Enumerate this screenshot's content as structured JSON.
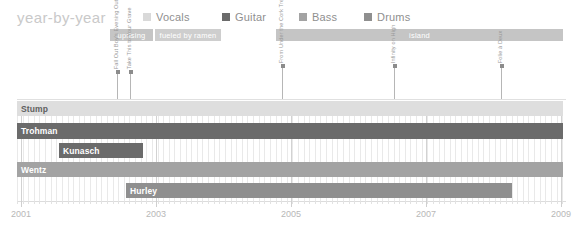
{
  "header": {
    "title": "year-by-year"
  },
  "legend": {
    "items": [
      {
        "label": "Vocals",
        "color": "#d9d9d9",
        "x": 0
      },
      {
        "label": "Guitar",
        "color": "#6b6b6b",
        "x": 79
      },
      {
        "label": "Bass",
        "color": "#a3a3a3",
        "x": 156
      },
      {
        "label": "Drums",
        "color": "#8f8f8f",
        "x": 221
      }
    ]
  },
  "label_bands": [
    {
      "name": "uprising",
      "color": "#c5c5c5",
      "left": 110,
      "width": 43
    },
    {
      "name": "fueled by ramen",
      "color": "#cecece",
      "left": 155,
      "width": 66
    },
    {
      "name": "island",
      "color": "#c5c5c5",
      "left": 276,
      "width": 287
    }
  ],
  "albums": [
    {
      "title": "Fall Out Boy's Evening Out with Your Girlfriend",
      "x": 117,
      "stem": 28
    },
    {
      "title": "Take This to Your Grave",
      "x": 130,
      "stem": 28
    },
    {
      "title": "From Under the Cork Tree",
      "x": 282,
      "stem": 34
    },
    {
      "title": "Infinity on High",
      "x": 394,
      "stem": 34
    },
    {
      "title": "Folie à Deux",
      "x": 501,
      "stem": 34
    }
  ],
  "chart_data": {
    "type": "bar",
    "title": "year-by-year",
    "xlabel": "",
    "ylabel": "",
    "xlim": [
      2001,
      2009.9
    ],
    "grid": true,
    "legend_position": "top",
    "categories": [
      "Stump",
      "Trohman",
      "Kunasch",
      "Wentz",
      "Hurley"
    ],
    "series": [
      {
        "name": "Stump",
        "role": "Vocals",
        "color": "#dedede",
        "start": 2001.0,
        "end": 2009.85,
        "label_color": "#6e6e6e"
      },
      {
        "name": "Trohman",
        "role": "Guitar",
        "color": "#6b6b6b",
        "start": 2001.0,
        "end": 2009.85,
        "label_color": "#ffffff"
      },
      {
        "name": "Kunasch",
        "role": "Guitar",
        "color": "#6b6b6b",
        "start": 2001.68,
        "end": 2003.03,
        "label_color": "#ffffff"
      },
      {
        "name": "Wentz",
        "role": "Bass",
        "color": "#a3a3a3",
        "start": 2001.0,
        "end": 2009.85,
        "label_color": "#ffffff"
      },
      {
        "name": "Hurley",
        "role": "Drums",
        "color": "#8f8f8f",
        "start": 2003.02,
        "end": 2009.05,
        "label_color": "#ffffff"
      }
    ]
  },
  "rows": [
    {
      "name": "Stump",
      "color": "#dedede",
      "left": 0,
      "width": 546,
      "top": 0,
      "height": 15,
      "label_color": "#5f5f5f"
    },
    {
      "name": "Trohman",
      "color": "#6b6b6b",
      "left": 0,
      "width": 546,
      "top": 22,
      "height": 16,
      "label_color": "#ffffff"
    },
    {
      "name": "Kunasch",
      "color": "#6b6b6b",
      "left": 42,
      "width": 84,
      "top": 42,
      "height": 15,
      "label_color": "#ffffff"
    },
    {
      "name": "Wentz",
      "color": "#a3a3a3",
      "left": 0,
      "width": 546,
      "top": 61,
      "height": 15,
      "label_color": "#ffffff"
    },
    {
      "name": "Hurley",
      "color": "#8f8f8f",
      "left": 109,
      "width": 386,
      "top": 82,
      "height": 15,
      "label_color": "#ffffff"
    }
  ],
  "axis": {
    "years": [
      {
        "label": "2001",
        "x": 4
      },
      {
        "label": "2003",
        "x": 139
      },
      {
        "label": "2005",
        "x": 274
      },
      {
        "label": "2007",
        "x": 409
      },
      {
        "label": "2009",
        "x": 544
      }
    ],
    "minor_step": 5.62,
    "minor_count": 98
  }
}
